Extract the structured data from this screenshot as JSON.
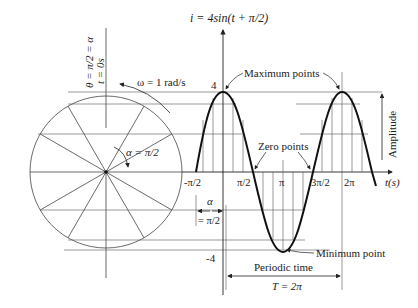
{
  "title": "i = 4sin(t + π/2)",
  "circle_labels": {
    "theta": "θ = π/2 = α",
    "time": "t = 0s",
    "omega": "ω = 1 rad/s",
    "alpha": "α = π/2"
  },
  "axis": {
    "t_label": "t(s)",
    "max_tick": "4",
    "min_tick": "-4",
    "ticks": [
      "-π/2",
      "π/2",
      "π",
      "3π/2",
      "2π"
    ]
  },
  "annotations": {
    "maximum": "Maximum points",
    "zero": "Zero points",
    "minimum": "Minimum point",
    "amplitude": "Amplitude",
    "periodic_time": "Periodic time",
    "period_value": "T = 2π",
    "phase_alpha": "α",
    "phase_value": "= π/2"
  },
  "colors": {
    "line": "#333333",
    "curve": "#111111",
    "text": "#222222"
  }
}
